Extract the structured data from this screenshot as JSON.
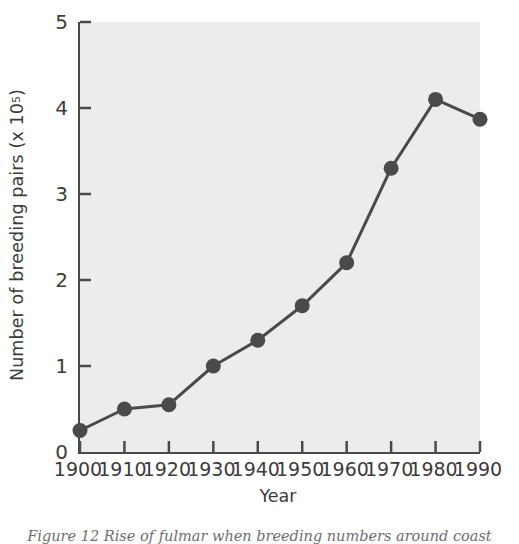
{
  "figure": {
    "caption": "Figure 12 Rise of fulmar when breeding numbers around coast",
    "background_color": "#ffffff",
    "plot_background_color": "#ececec",
    "axis_color": "#4a4a4a",
    "marker_color": "#4a4a4a"
  },
  "chart_data": {
    "type": "line",
    "title": "",
    "subtitle": "",
    "xlabel": "Year",
    "ylabel": "Number of breeding pairs (x 10⁵)",
    "ylabel_text": "Number of breeding pairs (x 10",
    "ylabel_exponent": "5",
    "ylabel_tail": ")",
    "x": [
      1900,
      1910,
      1920,
      1930,
      1940,
      1950,
      1960,
      1970,
      1980,
      1990
    ],
    "values": [
      0.25,
      0.5,
      0.55,
      1.0,
      1.3,
      1.7,
      2.2,
      3.3,
      4.1,
      3.87
    ],
    "categories": [
      "1900",
      "1910",
      "1920",
      "1930",
      "1940",
      "1950",
      "1960",
      "1970",
      "1980",
      "1990"
    ],
    "xlim": [
      1900,
      1990
    ],
    "ylim": [
      0,
      5
    ],
    "xticks": [
      1900,
      1910,
      1920,
      1930,
      1940,
      1950,
      1960,
      1970,
      1980,
      1990
    ],
    "yticks": [
      0,
      1,
      2,
      3,
      4,
      5
    ],
    "xtick_labels": [
      "1900",
      "1910",
      "1920",
      "1930",
      "1940",
      "1950",
      "1960",
      "1970",
      "1980",
      "1990"
    ],
    "ytick_labels": [
      "0",
      "1",
      "2",
      "3",
      "4",
      "5"
    ],
    "grid": false,
    "legend": null,
    "legend_position": "none",
    "marker": "circle",
    "marker_size": 15,
    "line_width": 3,
    "series": [
      {
        "name": "Number of breeding pairs",
        "values": [
          0.25,
          0.5,
          0.55,
          1.0,
          1.3,
          1.7,
          2.2,
          3.3,
          4.1,
          3.87
        ]
      }
    ]
  }
}
